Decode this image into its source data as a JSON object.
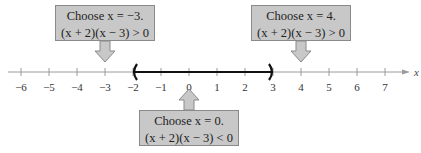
{
  "figure": {
    "axis": {
      "label": "x",
      "min": -6,
      "max": 7,
      "ticks": [
        -6,
        -5,
        -4,
        -3,
        -2,
        -1,
        0,
        1,
        2,
        3,
        4,
        5,
        6,
        7
      ],
      "tick_labels": [
        "−6",
        "−5",
        "−4",
        "−3",
        "−2",
        "−1",
        "0",
        "1",
        "2",
        "3",
        "4",
        "5",
        "6",
        "7"
      ]
    },
    "interval": {
      "left": -2,
      "right": 3,
      "left_bracket": "(",
      "right_bracket": ")",
      "open": true
    },
    "test_points": [
      {
        "x": -3,
        "line1": "Choose x = −3.",
        "line2": "(x + 2)(x − 3) > 0",
        "position": "above",
        "sign": "positive"
      },
      {
        "x": 0,
        "line1": "Choose x = 0.",
        "line2": "(x + 2)(x − 3) < 0",
        "position": "below",
        "sign": "negative"
      },
      {
        "x": 4,
        "line1": "Choose x = 4.",
        "line2": "(x + 2)(x − 3) > 0",
        "position": "above",
        "sign": "positive"
      }
    ],
    "colors": {
      "box_fill": "#c8c8c8",
      "box_border": "#8a8a8a",
      "axis": "#999999",
      "interval": "#111111"
    }
  }
}
